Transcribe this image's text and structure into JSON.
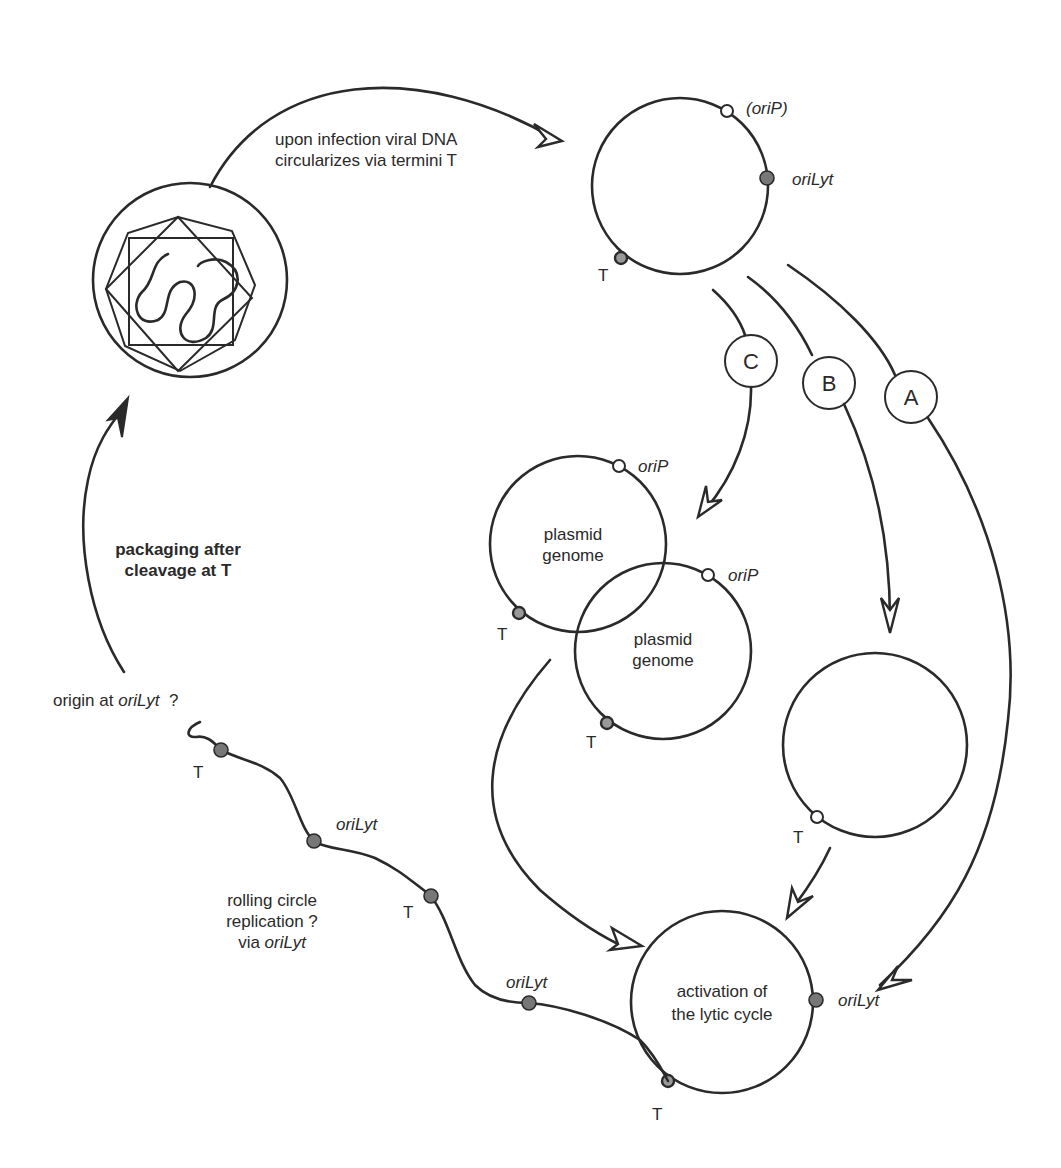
{
  "diagram": {
    "title": "",
    "virion": {
      "label": ""
    },
    "arrows": {
      "infection": {
        "line1": "upon infection viral DNA",
        "line2": "circularizes via termini T"
      },
      "packaging": {
        "line1": "packaging after",
        "line2": "cleavage at T"
      }
    },
    "circular_genome": {
      "orip_label": "(oriP)",
      "orilyt_label": "oriLyt",
      "t_label": "T"
    },
    "routes": {
      "a": "A",
      "b": "B",
      "c": "C"
    },
    "plasmid_1": {
      "line1": "plasmid",
      "line2": "genome",
      "orip_label": "oriP",
      "t_label": "T"
    },
    "plasmid_2": {
      "line1": "plasmid",
      "line2": "genome",
      "orip_label": "oriP",
      "t_label": "T"
    },
    "route_b_circle": {
      "t_label": "T"
    },
    "lytic_circle": {
      "line1": "activation of",
      "line2": "the lytic cycle",
      "orilyt_label": "oriLyt",
      "t_label": "T"
    },
    "rolling_circle": {
      "origin_prefix": "origin at ",
      "origin_italic": "oriLyt",
      "origin_suffix": "  ?",
      "t1_label": "T",
      "orilyt1_label": "oriLyt",
      "t2_label": "T",
      "orilyt2_label": "oriLyt",
      "replication_line1": "rolling circle",
      "replication_line2": "replication ?",
      "replication_line3_prefix": "via ",
      "replication_line3_italic": "oriLyt"
    }
  }
}
